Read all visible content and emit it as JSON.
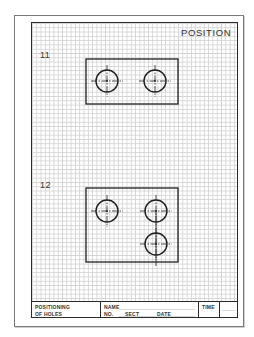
{
  "sheet": {
    "title": "POSITION",
    "problems": [
      {
        "number": "11",
        "part": {
          "x": 86,
          "y": 59,
          "w": 92,
          "h": 45
        },
        "holes": [
          {
            "cx": 107,
            "cy": 81,
            "r": 11
          },
          {
            "cx": 155,
            "cy": 81,
            "r": 11
          }
        ]
      },
      {
        "number": "12",
        "part": {
          "x": 86,
          "y": 188,
          "w": 92,
          "h": 74
        },
        "holes": [
          {
            "cx": 107,
            "cy": 211,
            "r": 11
          },
          {
            "cx": 156,
            "cy": 211,
            "r": 11
          },
          {
            "cx": 156,
            "cy": 244,
            "r": 11
          }
        ]
      }
    ]
  },
  "title_block": {
    "subject_line1": "POSITIONING",
    "subject_line2": "OF HOLES",
    "name_label": "NAME",
    "no_label": "NO.",
    "sect_label": "SECT",
    "date_label": "DATE",
    "time_label": "TIME"
  },
  "colors": {
    "line": "#1e1e1e",
    "grid": "#d4d4d4",
    "text": "#333333"
  }
}
